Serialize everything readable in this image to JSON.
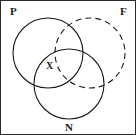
{
  "figure": {
    "type": "venn-diagram",
    "width": 136,
    "height": 135,
    "background_color": "#ffffff",
    "border_color": "#2b2b2b",
    "stroke_color": "#1a1a1a"
  },
  "labels": {
    "p": "P",
    "f": "F",
    "n": "N",
    "x": "X"
  },
  "circles": [
    {
      "id": "circle-p",
      "label": "P",
      "cx": 47,
      "cy": 52,
      "r": 35,
      "line_style": "solid",
      "stroke": "#1a1a1a",
      "stroke_width": 1.1
    },
    {
      "id": "circle-f",
      "label": "F",
      "cx": 89,
      "cy": 52,
      "r": 35,
      "line_style": "dashed",
      "dash_pattern": "6 4",
      "stroke": "#1a1a1a",
      "stroke_width": 1.1
    },
    {
      "id": "circle-n",
      "label": "N",
      "cx": 68,
      "cy": 83,
      "r": 35,
      "line_style": "solid",
      "stroke": "#1a1a1a",
      "stroke_width": 1.1
    }
  ],
  "region_markers": [
    {
      "id": "marker-x",
      "text": "X",
      "x": 49,
      "y": 66,
      "region": "P-and-N"
    }
  ]
}
